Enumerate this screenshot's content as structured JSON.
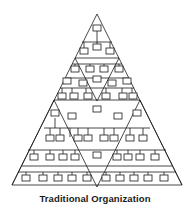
{
  "caption": "Traditional Organization",
  "colors": {
    "line": "#1a1a1a",
    "background": "#ffffff",
    "box_fill": "#ffffff"
  },
  "diagram": {
    "outer_triangle": {
      "apex": [
        97,
        14
      ],
      "left": [
        12,
        185
      ],
      "right": [
        182,
        185
      ]
    },
    "inverted_triangles": 3,
    "levels": 8
  }
}
